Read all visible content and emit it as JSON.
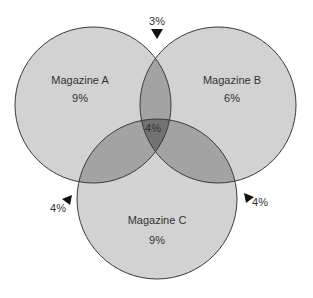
{
  "diagram": {
    "type": "venn",
    "sets": [
      {
        "id": "A",
        "label": "Magazine A",
        "only_value": "9%",
        "cx": 93,
        "cy": 105,
        "r": 78
      },
      {
        "id": "B",
        "label": "Magazine B",
        "only_value": "6%",
        "cx": 218,
        "cy": 105,
        "r": 78
      },
      {
        "id": "C",
        "label": "Magazine C",
        "only_value": "9%",
        "cx": 157,
        "cy": 199,
        "r": 80
      }
    ],
    "intersections": {
      "AB": "3%",
      "AC": "4%",
      "BC": "4%",
      "ABC": "4%"
    },
    "colors": {
      "single": "#d2d2d2",
      "double": "#a3a3a3",
      "triple": "#727272",
      "stroke": "#3a3a3a",
      "text": "#333333",
      "arrow": "#111111"
    }
  }
}
